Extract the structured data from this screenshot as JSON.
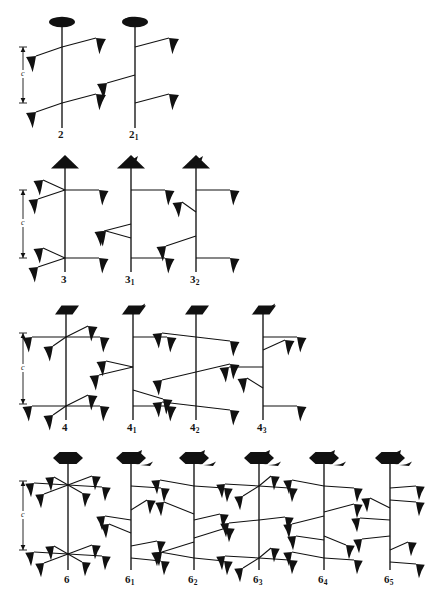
{
  "figure": {
    "lattice_label": "c",
    "axis_color": "#111111",
    "symbol_color": "#000000",
    "background": "#ffffff"
  },
  "rows": [
    {
      "order": 2,
      "row_index": 0,
      "has_c_marker": true,
      "c_marker": {
        "label": "c",
        "x": 22,
        "top": 47,
        "bottom": 103
      },
      "items": [
        {
          "name": "2",
          "label_main": "2",
          "label_sub": "",
          "head": "lens",
          "screw_tail": false,
          "axis_x": 62,
          "axis_top": 22,
          "axis_bottom": 128,
          "label_x": 62,
          "label_y": 130,
          "arms": [
            {
              "y": 47,
              "dir": "right",
              "rise": -8,
              "len": 32
            },
            {
              "y": 47,
              "dir": "left",
              "rise": 8,
              "len": 24
            },
            {
              "y": 103,
              "dir": "right",
              "rise": -8,
              "len": 32
            },
            {
              "y": 103,
              "dir": "left",
              "rise": 8,
              "len": 24
            }
          ]
        },
        {
          "name": "2sub1",
          "label_main": "2",
          "label_sub": "1",
          "head": "lens",
          "screw_tail": true,
          "axis_x": 135,
          "axis_top": 22,
          "axis_bottom": 128,
          "label_x": 135,
          "label_y": 130,
          "arms": [
            {
              "y": 47,
              "dir": "right",
              "rise": -8,
              "len": 32
            },
            {
              "y": 75,
              "dir": "left",
              "rise": 8,
              "len": 28
            },
            {
              "y": 103,
              "dir": "right",
              "rise": -8,
              "len": 32
            }
          ]
        }
      ]
    },
    {
      "order": 3,
      "row_index": 1,
      "has_c_marker": true,
      "c_marker": {
        "label": "c",
        "x": 22,
        "top": 190,
        "bottom": 257
      },
      "items": [
        {
          "name": "3",
          "label_main": "3",
          "label_sub": "",
          "head": "triangle",
          "screw_tail": false,
          "axis_x": 65,
          "axis_top": 164,
          "axis_bottom": 272,
          "label_x": 65,
          "label_y": 274
        },
        {
          "name": "3sub1",
          "label_main": "3",
          "label_sub": "1",
          "head": "triangle",
          "screw_tail": true,
          "axis_x": 131,
          "axis_top": 164,
          "axis_bottom": 272,
          "label_x": 131,
          "label_y": 274
        },
        {
          "name": "3sub2",
          "label_main": "3",
          "label_sub": "2",
          "head": "triangle",
          "screw_tail": true,
          "axis_x": 196,
          "axis_top": 164,
          "axis_bottom": 272,
          "label_x": 196,
          "label_y": 274
        }
      ]
    },
    {
      "order": 4,
      "row_index": 2,
      "has_c_marker": true,
      "c_marker": {
        "label": "c",
        "x": 22,
        "top": 333,
        "bottom": 400
      },
      "items": [
        {
          "name": "4",
          "label_main": "4",
          "label_sub": "",
          "head": "square",
          "screw_tail": false,
          "axis_x": 66,
          "axis_top": 310,
          "axis_bottom": 420,
          "label_x": 66,
          "label_y": 423
        },
        {
          "name": "4sub1",
          "label_main": "4",
          "label_sub": "1",
          "head": "square",
          "screw_tail": true,
          "axis_x": 133,
          "axis_top": 310,
          "axis_bottom": 420,
          "label_x": 133,
          "label_y": 423
        },
        {
          "name": "4sub2",
          "label_main": "4",
          "label_sub": "2",
          "head": "square",
          "screw_tail": false,
          "axis_x": 196,
          "axis_top": 310,
          "axis_bottom": 420,
          "label_x": 196,
          "label_y": 423
        },
        {
          "name": "4sub3",
          "label_main": "4",
          "label_sub": "3",
          "head": "square",
          "screw_tail": true,
          "axis_x": 263,
          "axis_top": 310,
          "axis_bottom": 420,
          "label_x": 263,
          "label_y": 423
        }
      ]
    },
    {
      "order": 6,
      "row_index": 3,
      "has_c_marker": true,
      "c_marker": {
        "label": "c",
        "x": 22,
        "top": 479,
        "bottom": 548
      },
      "items": [
        {
          "name": "6",
          "label_main": "6",
          "label_sub": "",
          "head": "hexagon",
          "screw_tail": false,
          "axis_x": 68,
          "axis_top": 458,
          "axis_bottom": 570,
          "label_x": 68,
          "label_y": 574
        },
        {
          "name": "6sub1",
          "label_main": "6",
          "label_sub": "1",
          "head": "hexagon",
          "screw_tail": true,
          "axis_x": 131,
          "axis_top": 458,
          "axis_bottom": 570,
          "label_x": 131,
          "label_y": 574
        },
        {
          "name": "6sub2",
          "label_main": "6",
          "label_sub": "2",
          "head": "hexagon",
          "screw_tail": true,
          "axis_x": 194,
          "axis_top": 458,
          "axis_bottom": 570,
          "label_x": 194,
          "label_y": 574
        },
        {
          "name": "6sub3",
          "label_main": "6",
          "label_sub": "3",
          "head": "hexagon",
          "screw_tail": true,
          "axis_x": 259,
          "axis_top": 458,
          "axis_bottom": 570,
          "label_x": 259,
          "label_y": 574
        },
        {
          "name": "6sub4",
          "label_main": "6",
          "label_sub": "4",
          "head": "hexagon",
          "screw_tail": true,
          "axis_x": 324,
          "axis_top": 458,
          "axis_bottom": 570,
          "label_x": 324,
          "label_y": 574
        },
        {
          "name": "6sub5",
          "label_main": "6",
          "label_sub": "5",
          "head": "hexagon",
          "screw_tail": true,
          "axis_x": 390,
          "axis_top": 458,
          "axis_bottom": 570,
          "label_x": 390,
          "label_y": 574
        }
      ]
    }
  ],
  "labels": [
    {
      "id": "lab-2",
      "main": "2",
      "sub": "",
      "x": 62,
      "y": 128
    },
    {
      "id": "lab-21",
      "main": "2",
      "sub": "1",
      "x": 133,
      "y": 128
    },
    {
      "id": "lab-3",
      "main": "3",
      "sub": "",
      "x": 65,
      "y": 273
    },
    {
      "id": "lab-31",
      "main": "3",
      "sub": "1",
      "x": 129,
      "y": 273
    },
    {
      "id": "lab-32",
      "main": "3",
      "sub": "2",
      "x": 194,
      "y": 273
    },
    {
      "id": "lab-4",
      "main": "4",
      "sub": "",
      "x": 66,
      "y": 421
    },
    {
      "id": "lab-41",
      "main": "4",
      "sub": "1",
      "x": 131,
      "y": 421
    },
    {
      "id": "lab-42",
      "main": "4",
      "sub": "2",
      "x": 194,
      "y": 421
    },
    {
      "id": "lab-43",
      "main": "4",
      "sub": "3",
      "x": 261,
      "y": 421
    },
    {
      "id": "lab-6",
      "main": "6",
      "sub": "",
      "x": 68,
      "y": 573
    },
    {
      "id": "lab-61",
      "main": "6",
      "sub": "1",
      "x": 129,
      "y": 573
    },
    {
      "id": "lab-62",
      "main": "6",
      "sub": "2",
      "x": 192,
      "y": 573
    },
    {
      "id": "lab-63",
      "main": "6",
      "sub": "3",
      "x": 257,
      "y": 573
    },
    {
      "id": "lab-64",
      "main": "6",
      "sub": "4",
      "x": 322,
      "y": 573
    },
    {
      "id": "lab-65",
      "main": "6",
      "sub": "5",
      "x": 388,
      "y": 573
    }
  ],
  "c_markers": [
    {
      "id": "c-2",
      "label": "c",
      "x": 23,
      "top": 47,
      "bottom": 103
    },
    {
      "id": "c-3",
      "label": "c",
      "x": 23,
      "top": 190,
      "bottom": 258
    },
    {
      "id": "c-4",
      "label": "c",
      "x": 23,
      "top": 333,
      "bottom": 404
    },
    {
      "id": "c-6",
      "label": "c",
      "x": 23,
      "top": 481,
      "bottom": 550
    }
  ]
}
